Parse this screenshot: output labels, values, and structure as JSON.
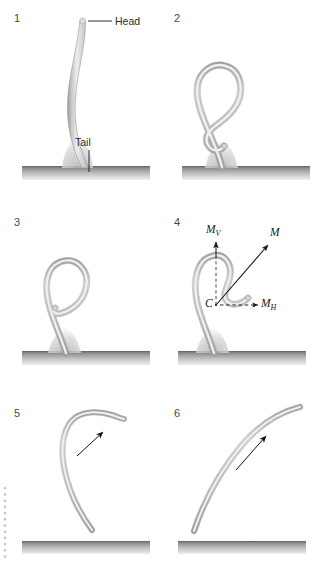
{
  "figure": {
    "panel_count": 6,
    "colors": {
      "body_fill": "#d2d2d2",
      "body_edge": "#9a9a9a",
      "body_highlight": "#f0f0f0",
      "ground_dark": "#6e6e6e",
      "ground_light": "#e8e8e8",
      "label_text": "#2b2b2b",
      "arrow": "#1a1a1a",
      "dotted": "#c8c8c8",
      "background": "#ffffff"
    }
  },
  "panels": [
    {
      "number": "1",
      "description": "Worm standing upright on ground, S-curved body with flared tail base",
      "labels": [
        {
          "text": "Head",
          "role": "head-label"
        },
        {
          "text": "Tail",
          "role": "tail-label"
        }
      ],
      "has_ground": true,
      "has_arrow": false
    },
    {
      "number": "2",
      "description": "Body coiled into a closed teardrop loop with crossing near base",
      "labels": [],
      "has_ground": true,
      "has_arrow": false
    },
    {
      "number": "3",
      "description": "Loop beginning to open, head curling outward to the right",
      "labels": [],
      "has_ground": true,
      "has_arrow": false
    },
    {
      "number": "4",
      "description": "Loop opening further with momentum vector decomposition at point C",
      "labels": [
        {
          "text": "M",
          "sub": "V",
          "role": "vertical-momentum-label"
        },
        {
          "text": "M",
          "sub": "",
          "role": "total-momentum-label"
        },
        {
          "text": "M",
          "sub": "H",
          "role": "horizontal-momentum-label"
        },
        {
          "text": "C",
          "sub": "",
          "role": "center-point-label"
        }
      ],
      "has_ground": true,
      "has_arrow": false,
      "vectors": [
        {
          "name": "M_V",
          "direction": "vertical-up",
          "style": "solid-arrow"
        },
        {
          "name": "M",
          "direction": "diagonal-up-right",
          "style": "solid-arrow"
        },
        {
          "name": "M_H",
          "direction": "horizontal-right",
          "style": "dashed-arrow"
        },
        {
          "name": "construction-vertical",
          "direction": "vertical-up",
          "style": "dashed"
        }
      ]
    },
    {
      "number": "5",
      "description": "Body airborne, hook-shaped curve above ground, motion arrow up-right",
      "labels": [],
      "has_ground": true,
      "has_arrow": true,
      "arrow_direction": "up-right"
    },
    {
      "number": "6",
      "description": "Body extended into a long arc in flight, motion arrow up-right",
      "labels": [],
      "has_ground": true,
      "has_arrow": true,
      "arrow_direction": "up-right"
    }
  ],
  "decorations": {
    "left_dotted_line": "vertical dotted rule at left margin of panel 5"
  }
}
